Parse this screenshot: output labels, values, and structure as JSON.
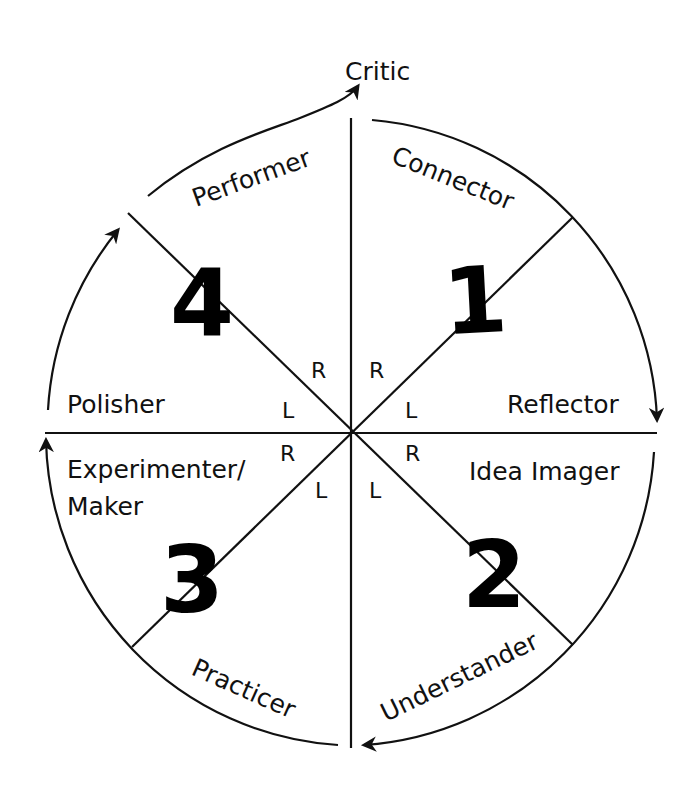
{
  "diagram": {
    "type": "learning-cycle-wheel",
    "colors": {
      "line": "#111111",
      "background": "#ffffff"
    },
    "top_label": "Critic",
    "quadrants": [
      {
        "number": "1",
        "roles": [
          "Connector",
          "Reflector"
        ]
      },
      {
        "number": "2",
        "roles": [
          "Idea Imager",
          "Understander"
        ]
      },
      {
        "number": "3",
        "roles": [
          "Practicer",
          "Experimenter/ Maker"
        ]
      },
      {
        "number": "4",
        "roles": [
          "Polisher",
          "Performer"
        ]
      }
    ],
    "labels": {
      "connector": "Connector",
      "reflector": "Reflector",
      "idea_imager": "Idea Imager",
      "understander": "Understander",
      "practicer": "Practicer",
      "experimenter_line1": "Experimenter/",
      "experimenter_line2": "Maker",
      "polisher": "Polisher",
      "performer": "Performer",
      "critic": "Critic"
    },
    "numbers": {
      "q1": "1",
      "q2": "2",
      "q3": "3",
      "q4": "4"
    },
    "hemisphere_marks": {
      "nw_upper": "R",
      "ne_upper": "R",
      "nw_lower": "L",
      "ne_lower": "L",
      "sw_upper": "R",
      "se_upper": "R",
      "sw_lower": "L",
      "se_lower": "L"
    }
  }
}
